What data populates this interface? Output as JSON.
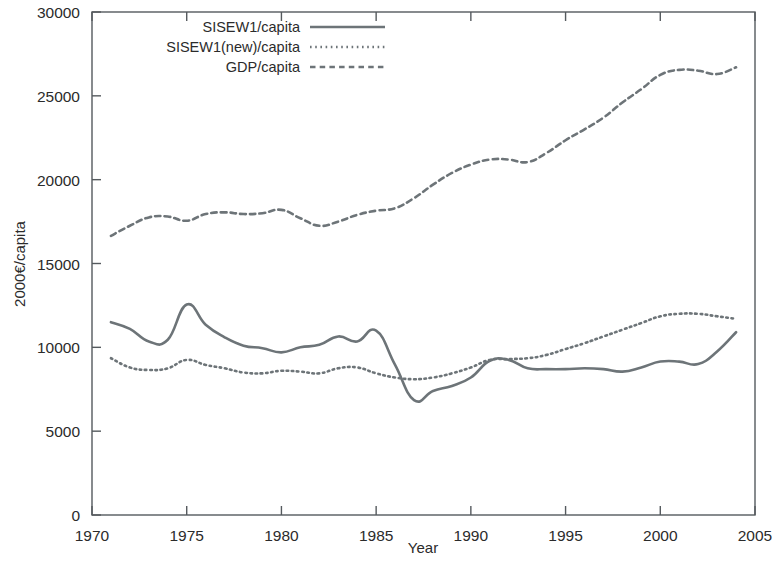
{
  "chart_data": {
    "type": "line",
    "title": "",
    "xlabel": "Year",
    "ylabel": "2000€/capita",
    "xlim": [
      1970,
      2005
    ],
    "ylim": [
      0,
      30000
    ],
    "xticks": [
      1970,
      1975,
      1980,
      1985,
      1990,
      1995,
      2000,
      2005
    ],
    "xtick_labels": [
      "1970",
      "1975",
      "1980",
      "1985",
      "1990",
      "1995",
      "2000",
      "2005"
    ],
    "yticks": [
      0,
      5000,
      10000,
      15000,
      20000,
      25000,
      30000
    ],
    "ytick_labels": [
      "0",
      "5000",
      "10000",
      "15000",
      "20000",
      "25000",
      "30000"
    ],
    "grid": false,
    "legend_position": "top-center",
    "x": [
      1971,
      1972,
      1973,
      1974,
      1975,
      1976,
      1977,
      1978,
      1979,
      1980,
      1981,
      1982,
      1983,
      1984,
      1985,
      1986,
      1987,
      1988,
      1989,
      1990,
      1991,
      1992,
      1993,
      1994,
      1995,
      1996,
      1997,
      1998,
      1999,
      2000,
      2001,
      2002,
      2003,
      2004
    ],
    "series": [
      {
        "name": "SISEW1/capita",
        "style": "solid",
        "values": [
          11500,
          11100,
          10350,
          10450,
          12550,
          11350,
          10600,
          10100,
          9950,
          9700,
          10000,
          10150,
          10650,
          10350,
          11000,
          8950,
          6850,
          7400,
          7700,
          8200,
          9200,
          9250,
          8750,
          8700,
          8700,
          8750,
          8700,
          8550,
          8800,
          9150,
          9150,
          9000,
          9750,
          10900
        ]
      },
      {
        "name": "SISEW1(new)/capita",
        "style": "dotted",
        "values": [
          9350,
          8800,
          8650,
          8750,
          9250,
          8950,
          8750,
          8500,
          8450,
          8600,
          8550,
          8450,
          8750,
          8800,
          8450,
          8200,
          8100,
          8200,
          8450,
          8800,
          9250,
          9300,
          9350,
          9550,
          9900,
          10250,
          10650,
          11050,
          11450,
          11850,
          12000,
          12000,
          11850,
          11700
        ]
      },
      {
        "name": "GDP/capita",
        "style": "dashed",
        "values": [
          16650,
          17250,
          17750,
          17800,
          17550,
          17950,
          18050,
          17950,
          18000,
          18200,
          17700,
          17250,
          17500,
          17900,
          18150,
          18300,
          18900,
          19700,
          20400,
          20900,
          21200,
          21200,
          21050,
          21600,
          22350,
          23000,
          23700,
          24600,
          25400,
          26250,
          26550,
          26500,
          26300,
          26700
        ]
      }
    ]
  },
  "legend": {
    "items": [
      {
        "label": "SISEW1/capita",
        "style": "solid"
      },
      {
        "label": "SISEW1(new)/capita",
        "style": "dotted"
      },
      {
        "label": "GDP/capita",
        "style": "dashed"
      }
    ]
  },
  "axes": {
    "x_title": "Year",
    "y_title": "2000€/capita"
  }
}
